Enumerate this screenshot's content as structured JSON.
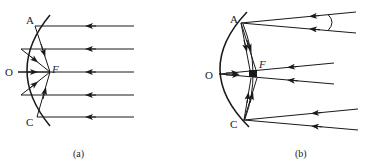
{
  "figure": {
    "panels": [
      {
        "id": "a",
        "caption": "(a)",
        "labels": {
          "top_point": "A",
          "vertex": "O",
          "focus": "F",
          "bottom_point": "C"
        },
        "description": "Concave mirror with parallel rays (parallel to principal axis) reflecting through focus F"
      },
      {
        "id": "b",
        "caption": "(b)",
        "labels": {
          "top_point": "A",
          "vertex": "O",
          "focus": "F",
          "bottom_point": "C"
        },
        "description": "Concave mirror with converging ray bundles at small angle reflecting to points near F; angle marked between upper rays"
      }
    ],
    "colors": {
      "line": "#1a1a1a",
      "background": "#ffffff"
    }
  }
}
